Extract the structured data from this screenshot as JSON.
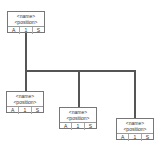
{
  "diagram": {
    "type": "org-chart",
    "colors": {
      "line": "#555555",
      "border": "#777777",
      "background": "#ffffff",
      "text": "#333333"
    },
    "nodes": [
      {
        "id": "root",
        "name": "<name>",
        "position": "<position>",
        "cells": [
          "A",
          "1",
          "S"
        ]
      },
      {
        "id": "child1",
        "name": "<name>",
        "position": "<position>",
        "cells": [
          "A",
          "1",
          "S"
        ]
      },
      {
        "id": "child2",
        "name": "<name>",
        "position": "<position>",
        "cells": [
          "A",
          "1",
          "S"
        ]
      },
      {
        "id": "child3",
        "name": "<name>",
        "position": "<position>",
        "cells": [
          "A",
          "1",
          "S"
        ]
      }
    ],
    "edges": [
      {
        "from": "root",
        "to": "child1"
      },
      {
        "from": "root",
        "to": "child2"
      },
      {
        "from": "root",
        "to": "child3"
      }
    ]
  }
}
